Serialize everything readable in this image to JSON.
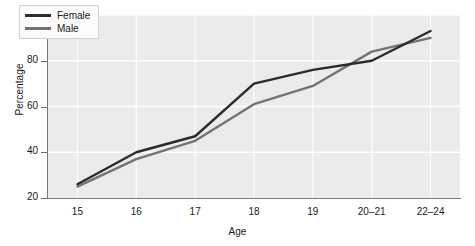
{
  "chart_data": {
    "type": "line",
    "title": "",
    "xlabel": "Age",
    "ylabel": "Percentage",
    "categories": [
      "15",
      "16",
      "17",
      "18",
      "19",
      "20–21",
      "22–24"
    ],
    "ylim": [
      20,
      100
    ],
    "yticks": [
      20,
      40,
      60,
      80,
      100
    ],
    "grid": true,
    "legend_position": "top-left-inside",
    "series": [
      {
        "name": "Female",
        "color": "#2b2b2b",
        "values": [
          26,
          40,
          47,
          70,
          76,
          80,
          93
        ]
      },
      {
        "name": "Male",
        "color": "#737373",
        "values": [
          25,
          37,
          45,
          61,
          69,
          84,
          90
        ]
      }
    ]
  },
  "colors": {
    "plot_background": "#ebebeb",
    "gridline": "#fdfdfd",
    "axis": "#7a7a7a",
    "text": "#1a1a1a",
    "legend_background": "#fbfbfb",
    "legend_border": "#d2d2d2"
  }
}
